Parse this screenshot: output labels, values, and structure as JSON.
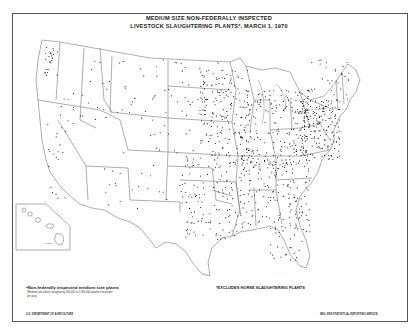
{
  "title": {
    "line1": "MEDIUM SIZE NON-FEDERALLY INSPECTED",
    "line2": "LIVESTOCK SLAUGHTERING PLANTS*, MARCH 1, 1970"
  },
  "legend": {
    "symbol": "•",
    "label": "Non-federally inspected medium size plants",
    "note_line1": "(Medium-size plants slaughtering 300,000 to 2,000,000 pounds live weight",
    "note_line2": "per year)"
  },
  "footnote": "*EXCLUDES HORSE SLAUGHTERING PLANTS",
  "credits": {
    "left": "U.S. DEPARTMENT OF AGRICULTURE",
    "right": "NEG. ERS  STATISTICAL REPORTING SERVICE"
  },
  "inset": {
    "label": "HAWAII"
  },
  "map": {
    "line_color": "#666666",
    "dot_color": "#111111",
    "background": "#ffffff"
  }
}
